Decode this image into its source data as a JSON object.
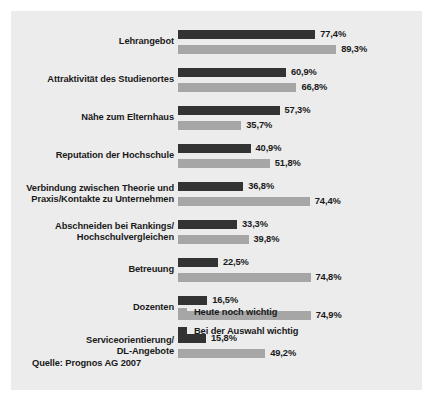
{
  "chart_data": {
    "type": "bar",
    "orientation": "horizontal",
    "title": "",
    "xlabel": "",
    "ylabel": "",
    "xlim": [
      0,
      100
    ],
    "grid": false,
    "legend_position": "bottom-left-of-plot",
    "unit": "%",
    "categories": [
      "Lehrangebot",
      "Attraktivität des Studienortes",
      "Nähe zum Elternhaus",
      "Reputation der Hochschule",
      "Verbindung zwischen Theorie und\nPraxis/Kontakte zu Unternehmen",
      "Abschneiden bei Rankings/\nHochschulvergleichen",
      "Betreuung",
      "Dozenten",
      "Serviceorientierung/\nDL-Angebote"
    ],
    "series": [
      {
        "name": "Bei der Auswahl wichtig",
        "color": "#333333",
        "values": [
          77.4,
          60.9,
          57.3,
          40.9,
          36.8,
          33.3,
          22.5,
          16.5,
          15.8
        ],
        "labels": [
          "77,4%",
          "60,9%",
          "57,3%",
          "40,9%",
          "36,8%",
          "33,3%",
          "22,5%",
          "16,5%",
          "15,8%"
        ]
      },
      {
        "name": "Heute noch wichtig",
        "color": "#a6a6a6",
        "values": [
          89.3,
          66.8,
          35.7,
          51.8,
          74.4,
          39.8,
          74.8,
          74.9,
          49.2
        ],
        "labels": [
          "89,3%",
          "66,8%",
          "35,7%",
          "51,8%",
          "74,4%",
          "39,8%",
          "74,8%",
          "74,9%",
          "49,2%"
        ]
      }
    ],
    "legend": [
      {
        "label": "Heute noch wichtig",
        "color": "#a6a6a6"
      },
      {
        "label": "Bei der Auswahl wichtig",
        "color": "#333333"
      }
    ],
    "source": "Quelle: Prognos AG 2007"
  },
  "panel": {
    "background_color": "#ececec"
  }
}
